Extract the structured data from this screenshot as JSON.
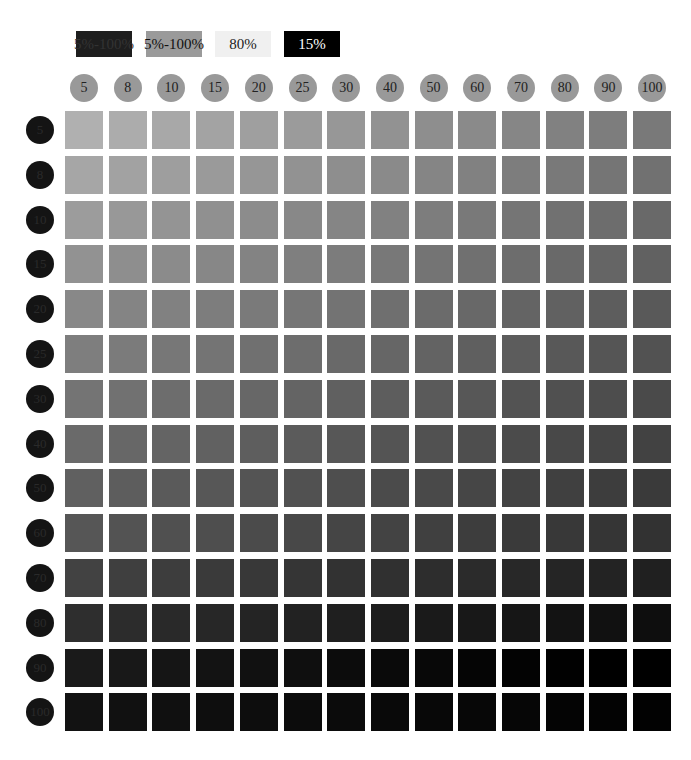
{
  "legend": [
    {
      "label": "5%-100%",
      "bg": "#1e1e1e",
      "fg": "#333333",
      "x": 76,
      "w": 56
    },
    {
      "label": "5%-100%",
      "bg": "#9a9a9a",
      "fg": "#111111",
      "x": 146,
      "w": 56
    },
    {
      "label": "80%",
      "bg": "#f0f0f0",
      "fg": "#222222",
      "x": 215,
      "w": 56
    },
    {
      "label": "15%",
      "bg": "#000000",
      "fg": "#ffffff",
      "x": 284,
      "w": 56
    }
  ],
  "columns": [
    "5",
    "8",
    "10",
    "15",
    "20",
    "25",
    "30",
    "40",
    "50",
    "60",
    "70",
    "80",
    "90",
    "100"
  ],
  "rows": [
    "5",
    "8",
    "10",
    "15",
    "20",
    "25",
    "30",
    "40",
    "50",
    "60",
    "70",
    "80",
    "90",
    "100"
  ],
  "grid": {
    "left": 65,
    "top": 111,
    "col_step": 43.7,
    "row_step": 44.8,
    "cell": 38
  }
}
